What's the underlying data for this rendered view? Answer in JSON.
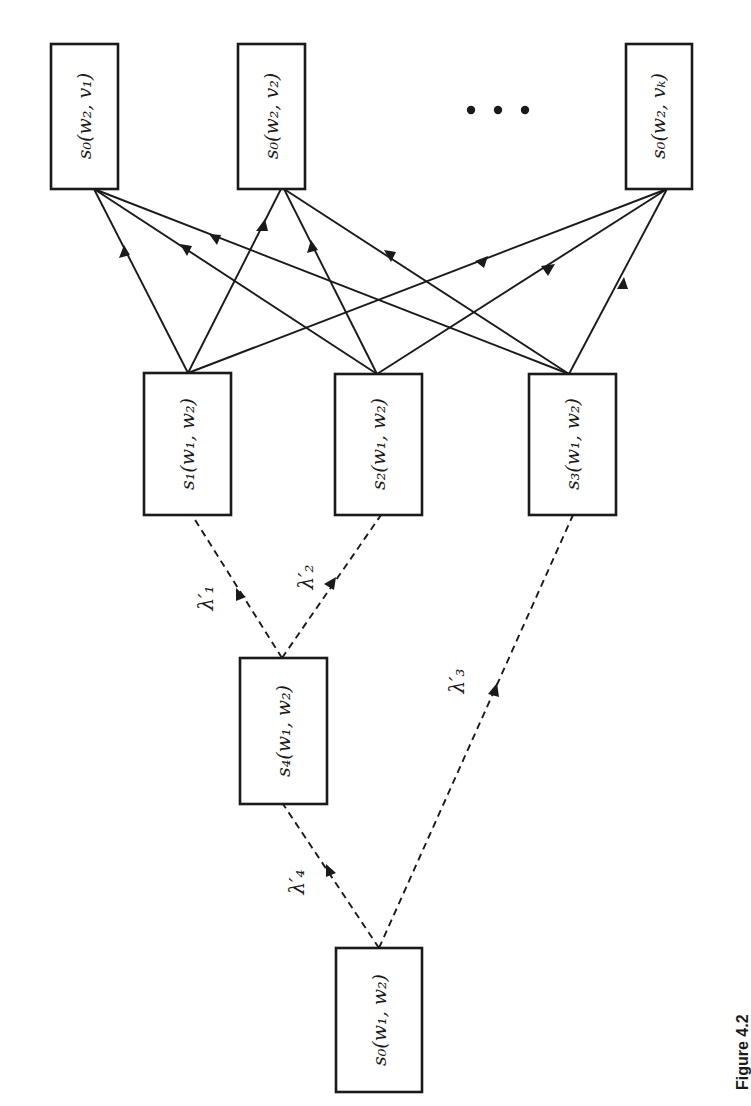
{
  "figure": {
    "caption": "Figure 4.2",
    "orientation": "rotated 90° counter-clockwise",
    "ellipsis": "• • •"
  },
  "nodes": {
    "top": [
      {
        "id": "s0_w2_v1",
        "label": "s₀(w₂, v₁)"
      },
      {
        "id": "s0_w2_v2",
        "label": "s₀(w₂, v₂)"
      },
      {
        "id": "s0_w2_vk",
        "label": "s₀(w₂, vₖ)"
      }
    ],
    "middle": [
      {
        "id": "s1_w1_w2",
        "label": "s₁(w₁, w₂)"
      },
      {
        "id": "s2_w1_w2",
        "label": "s₂(w₁, w₂)"
      },
      {
        "id": "s3_w1_w2",
        "label": "s₃(w₁, w₂)"
      }
    ],
    "s4": {
      "id": "s4_w1_w2",
      "label": "s₄(w₁, w₂)"
    },
    "root": {
      "id": "s0_w1_w2",
      "label": "s₀(w₁, w₂)"
    }
  },
  "edges": {
    "dashed": [
      {
        "from": "s0_w1_w2",
        "to": "s4_w1_w2",
        "label": "λ′₄"
      },
      {
        "from": "s0_w1_w2",
        "to": "s3_w1_w2",
        "label": "λ′₃"
      },
      {
        "from": "s4_w1_w2",
        "to": "s1_w1_w2",
        "label": "λ′₁"
      },
      {
        "from": "s4_w1_w2",
        "to": "s2_w1_w2",
        "label": "λ′₂"
      }
    ],
    "solid": [
      {
        "from": "s1_w1_w2",
        "to": "s0_w2_v1"
      },
      {
        "from": "s1_w1_w2",
        "to": "s0_w2_v2"
      },
      {
        "from": "s1_w1_w2",
        "to": "s0_w2_vk"
      },
      {
        "from": "s2_w1_w2",
        "to": "s0_w2_v1"
      },
      {
        "from": "s2_w1_w2",
        "to": "s0_w2_v2"
      },
      {
        "from": "s2_w1_w2",
        "to": "s0_w2_vk"
      },
      {
        "from": "s3_w1_w2",
        "to": "s0_w2_v1"
      },
      {
        "from": "s3_w1_w2",
        "to": "s0_w2_v2"
      },
      {
        "from": "s3_w1_w2",
        "to": "s0_w2_vk"
      }
    ]
  }
}
